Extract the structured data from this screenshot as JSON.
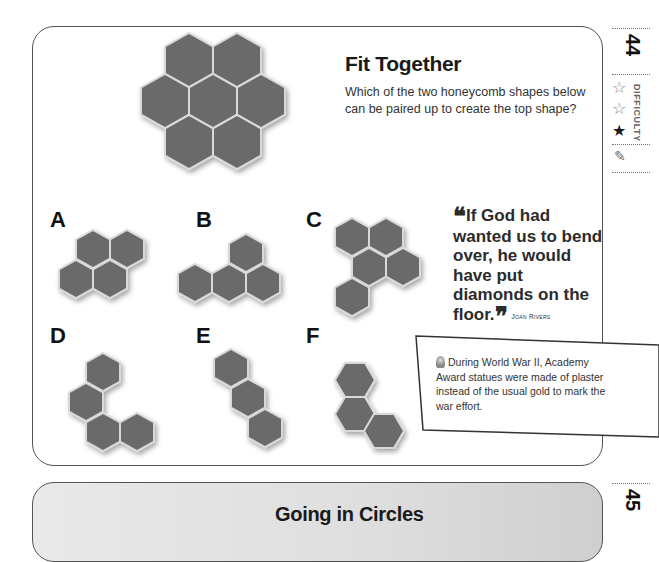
{
  "puzzle": {
    "number": "44",
    "title": "Fit Together",
    "instructions": "Which of the two honeycomb shapes below can be paired up to create the top shape?",
    "difficulty_label": "DIFFICULTY",
    "difficulty_stars": [
      {
        "filled": false,
        "glyph": "☆"
      },
      {
        "filled": false,
        "glyph": "☆"
      },
      {
        "filled": true,
        "glyph": "★"
      }
    ],
    "pencil_icon": "✎",
    "options": [
      {
        "label": "A"
      },
      {
        "label": "B"
      },
      {
        "label": "C"
      },
      {
        "label": "D"
      },
      {
        "label": "E"
      },
      {
        "label": "F"
      }
    ]
  },
  "quote": {
    "open_mark": "❝",
    "text": "If God had wanted us to bend over, he would have put diamonds on the floor.",
    "close_mark": "❞",
    "author": "Joan Rivers"
  },
  "fact": {
    "icon": "lightbulb-icon",
    "text": "During World War II, Academy Award statues were made of plaster instead of the usual gold to mark the war effort."
  },
  "next_puzzle": {
    "number": "45",
    "title": "Going in Circles"
  },
  "colors": {
    "hex_fill": "#6b6b6b",
    "hex_stroke": "#d9d9d9",
    "border": "#555555"
  }
}
